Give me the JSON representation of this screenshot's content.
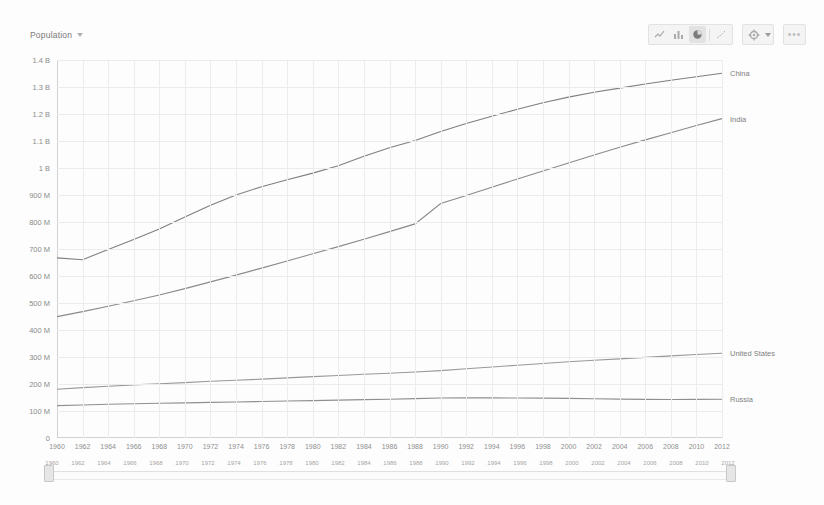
{
  "chart_title": "Population",
  "toolbar": {
    "icons": [
      {
        "name": "chart-type-line-icon",
        "selected": false
      },
      {
        "name": "chart-type-bar-icon",
        "selected": false
      },
      {
        "name": "chart-type-pie-icon",
        "selected": true
      },
      {
        "name": "chart-type-scatter-icon",
        "selected": false
      }
    ],
    "settings_icon": "gear-icon",
    "settings_caret": "chevron-down-icon",
    "more_label": "•••"
  },
  "slider": {
    "start_year": "1960",
    "end_year": "2012",
    "ticks": [
      "1960",
      "1962",
      "1964",
      "1966",
      "1968",
      "1970",
      "1972",
      "1974",
      "1976",
      "1978",
      "1980",
      "1982",
      "1984",
      "1986",
      "1988",
      "1990",
      "1992",
      "1994",
      "1996",
      "1998",
      "2000",
      "2002",
      "2004",
      "2006",
      "2008",
      "2010",
      "2012"
    ]
  },
  "chart_data": {
    "type": "line",
    "title": "Population",
    "xlabel": "",
    "ylabel": "",
    "grid": true,
    "legend_position": "right-inline",
    "xlim": [
      1960,
      2012
    ],
    "ylim": [
      0,
      1400000000
    ],
    "ytick_labels": [
      "0",
      "100 M",
      "200 M",
      "300 M",
      "400 M",
      "500 M",
      "600 M",
      "700 M",
      "800 M",
      "900 M",
      "1 B",
      "1.1 B",
      "1.2 B",
      "1.3 B",
      "1.4 B"
    ],
    "ytick_values": [
      0,
      100000000,
      200000000,
      300000000,
      400000000,
      500000000,
      600000000,
      700000000,
      800000000,
      900000000,
      1000000000,
      1100000000,
      1200000000,
      1300000000,
      1400000000
    ],
    "xtick_labels": [
      "1960",
      "1962",
      "1964",
      "1966",
      "1968",
      "1970",
      "1972",
      "1974",
      "1976",
      "1978",
      "1980",
      "1982",
      "1984",
      "1986",
      "1988",
      "1990",
      "1992",
      "1994",
      "1996",
      "1998",
      "2000",
      "2002",
      "2004",
      "2006",
      "2008",
      "2010",
      "2012"
    ],
    "x": [
      1960,
      1962,
      1964,
      1966,
      1968,
      1970,
      1972,
      1974,
      1976,
      1978,
      1980,
      1982,
      1984,
      1986,
      1988,
      1990,
      1992,
      1994,
      1996,
      1998,
      2000,
      2002,
      2004,
      2006,
      2008,
      2010,
      2012
    ],
    "series": [
      {
        "name": "China",
        "color": "#7f7f7f",
        "values": [
          667070000,
          660330000,
          698355000,
          735400000,
          774510000,
          818315000,
          862030000,
          900350000,
          930685000,
          956165000,
          981235000,
          1008630000,
          1043570000,
          1075070000,
          1101630000,
          1135185000,
          1164970000,
          1191835000,
          1217550000,
          1241935000,
          1262645000,
          1280400000,
          1296075000,
          1311020000,
          1324655000,
          1337705000,
          1350695000
        ]
      },
      {
        "name": "India",
        "color": "#8a8a8a",
        "values": [
          449480000,
          468140000,
          487690000,
          508160000,
          529770000,
          553280000,
          578060000,
          603460000,
          629170000,
          655460000,
          682140000,
          708900000,
          736340000,
          764340000,
          792800000,
          868660000,
          898550000,
          928800000,
          959200000,
          989300000,
          1018880000,
          1048280000,
          1076705000,
          1104000000,
          1130710000,
          1157280000,
          1182870000
        ]
      },
      {
        "name": "United States",
        "color": "#999999",
        "values": [
          180670000,
          186540000,
          191890000,
          196560000,
          200710000,
          205050000,
          209900000,
          213850000,
          218040000,
          222580000,
          227225000,
          231665000,
          236000000,
          240130000,
          244500000,
          249620000,
          256510000,
          263130000,
          269390000,
          275850000,
          282160000,
          287625000,
          292805000,
          298380000,
          304090000,
          309350000,
          314000000
        ]
      },
      {
        "name": "Russia",
        "color": "#8f8f8f",
        "values": [
          119900000,
          122400000,
          124800000,
          126800000,
          128400000,
          130100000,
          131700000,
          133500000,
          135200000,
          137000000,
          138660000,
          140440000,
          142100000,
          143840000,
          146000000,
          148290000,
          148690000,
          148400000,
          148290000,
          147670000,
          146600000,
          145300000,
          143950000,
          143050000,
          142740000,
          142850000,
          143170000
        ]
      }
    ]
  }
}
